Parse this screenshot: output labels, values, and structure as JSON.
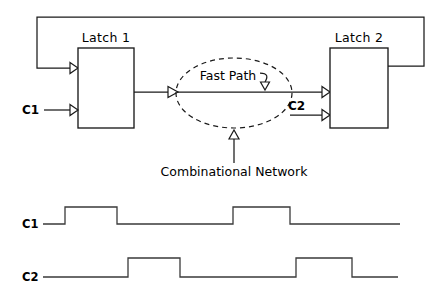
{
  "diagram": {
    "blocks": {
      "latch1_label": "Latch  1",
      "latch2_label": "Latch  2"
    },
    "signals": {
      "c1_input_label": "C1",
      "c2_input_label": "C2"
    },
    "cloud": {
      "fast_path_label": "Fast Path",
      "combinational_label": "Combinational Network"
    },
    "colors": {
      "line": "#1a1a1a",
      "wave": "#3a3a3a",
      "background": "#ffffff",
      "fill": "#ffffff"
    }
  },
  "timing": {
    "c1_label": "C1",
    "c2_label": "C2"
  },
  "chart_data": {
    "type": "line",
    "xlabel": "",
    "ylabel": "",
    "grid": false,
    "legend": "none",
    "series": [
      {
        "name": "C1",
        "low_level": 0,
        "high_level": 1,
        "baseline_start_x": 43,
        "end_x": 400,
        "pulses": [
          {
            "rise_x": 65,
            "fall_x": 117
          },
          {
            "rise_x": 233,
            "fall_x": 290
          }
        ]
      },
      {
        "name": "C2",
        "low_level": 0,
        "high_level": 1,
        "baseline_start_x": 43,
        "end_x": 398,
        "pulses": [
          {
            "rise_x": 128,
            "fall_x": 180
          },
          {
            "rise_x": 296,
            "fall_x": 352
          }
        ]
      }
    ]
  }
}
